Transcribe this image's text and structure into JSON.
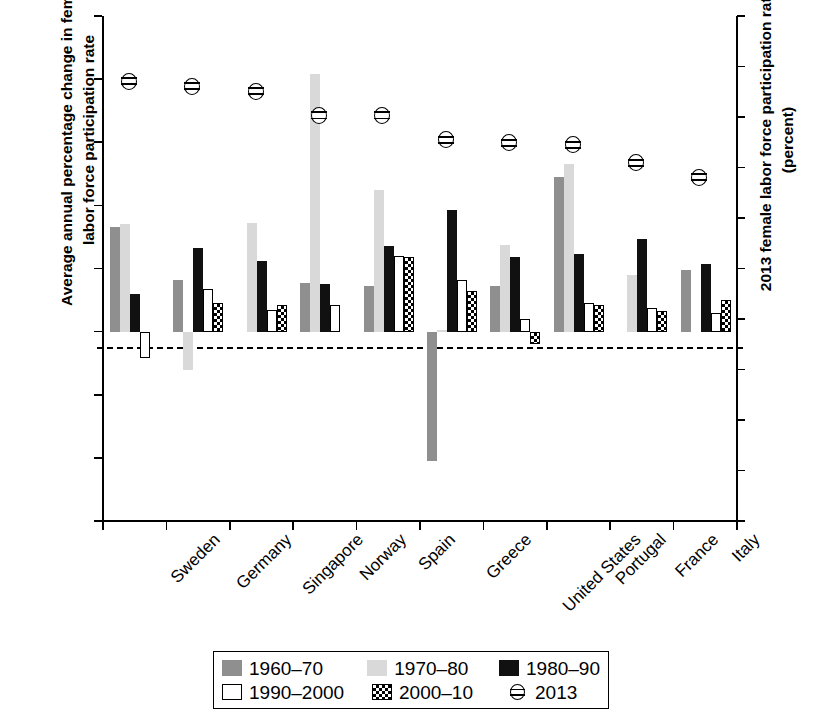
{
  "chart_data": {
    "type": "bar",
    "title": "",
    "ylabel": "Average annual percentage change in female labor force participation rate",
    "ylabel_right": "2013 female labor force participation rate (percent)",
    "xlabel": "",
    "ylim": [
      -6,
      10
    ],
    "ylim_right": [
      40,
      90
    ],
    "yticks": [
      "10",
      "8",
      "6",
      "4",
      "2",
      "0",
      "-2",
      "-4",
      "-6"
    ],
    "yticks_right": [
      "90",
      "85",
      "80",
      "75",
      "70",
      "65",
      "60",
      "55",
      "50",
      "45",
      "40"
    ],
    "grid": false,
    "legend_position": "bottom",
    "categories": [
      "Sweden",
      "Germany",
      "Singapore",
      "Norway",
      "Spain",
      "Greece",
      "United States",
      "Portugal",
      "France",
      "Italy"
    ],
    "series": [
      {
        "name": "1960–70",
        "color": "#8f8f8f",
        "values": [
          3.3,
          1.65,
          null,
          1.55,
          1.45,
          -4.1,
          1.45,
          4.9,
          null,
          1.95
        ]
      },
      {
        "name": "1970–80",
        "color": "#d9d9d9",
        "values": [
          3.4,
          -1.2,
          3.45,
          8.15,
          4.5,
          0.05,
          2.75,
          5.3,
          1.8,
          null
        ]
      },
      {
        "name": "1980–90",
        "color": "#111111",
        "values": [
          1.2,
          2.65,
          2.25,
          1.5,
          2.7,
          3.85,
          2.35,
          2.45,
          2.95,
          2.15
        ]
      },
      {
        "name": "1990–2000",
        "color": "#ffffff",
        "values": [
          -0.85,
          1.35,
          0.7,
          0.85,
          2.4,
          1.65,
          0.4,
          0.9,
          0.75,
          0.6
        ]
      },
      {
        "name": "2000–10",
        "color": "checkered",
        "values": [
          null,
          0.9,
          0.85,
          null,
          2.35,
          1.3,
          -0.4,
          0.85,
          0.65,
          1.0
        ]
      },
      {
        "name": "2013",
        "color": "marker",
        "right_axis": true,
        "values": [
          83.6,
          83.1,
          82.6,
          80.2,
          80.2,
          77.8,
          77.5,
          77.3,
          75.5,
          74.1
        ]
      }
    ],
    "legend": [
      {
        "label": "1960–70",
        "swatch": "dark-gray-fill"
      },
      {
        "label": "1970–80",
        "swatch": "light-gray-fill"
      },
      {
        "label": "1980–90",
        "swatch": "black-fill"
      },
      {
        "label": "1990–2000",
        "swatch": "white-fill"
      },
      {
        "label": "2000–10",
        "swatch": "checkered-fill"
      },
      {
        "label": "2013",
        "swatch": "circle-hline-marker"
      }
    ]
  }
}
